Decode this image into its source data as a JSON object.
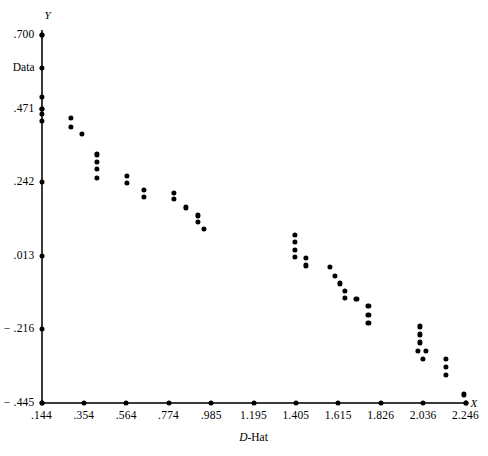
{
  "chart_data": {
    "type": "scatter",
    "title": "",
    "subtitle": "",
    "xlabel": "D-Hat",
    "ylabel": "Data",
    "x_axis_symbol": "X",
    "y_axis_symbol": "Y",
    "xlim": [
      0.144,
      2.246
    ],
    "ylim": [
      -0.445,
      0.7
    ],
    "grid": false,
    "legend": "none",
    "x_ticks": [
      0.144,
      0.354,
      0.564,
      0.774,
      0.985,
      1.195,
      1.405,
      1.615,
      1.826,
      2.036,
      2.246
    ],
    "x_tick_labels": [
      ".144",
      ".354",
      ".564",
      ".774",
      ".985",
      "1.195",
      "1.405",
      "1.615",
      "1.826",
      "2.036",
      "2.246"
    ],
    "y_ticks": [
      0.7,
      0.471,
      0.242,
      0.013,
      -0.216,
      -0.445
    ],
    "y_tick_labels": [
      ".700",
      ".471",
      ".242",
      ".013",
      "− .216",
      "− .445"
    ],
    "series": [
      {
        "name": "Data",
        "marker": "filled-circle",
        "color": "#000000",
        "points": [
          [
            0.144,
            0.7
          ],
          [
            0.144,
            0.597
          ],
          [
            0.144,
            0.508
          ],
          [
            0.144,
            0.471
          ],
          [
            0.144,
            0.455
          ],
          [
            0.144,
            0.432
          ],
          [
            0.29,
            0.441
          ],
          [
            0.29,
            0.414
          ],
          [
            0.345,
            0.393
          ],
          [
            0.42,
            0.328
          ],
          [
            0.42,
            0.305
          ],
          [
            0.42,
            0.283
          ],
          [
            0.42,
            0.256
          ],
          [
            0.566,
            0.262
          ],
          [
            0.566,
            0.238
          ],
          [
            0.65,
            0.218
          ],
          [
            0.65,
            0.196
          ],
          [
            0.8,
            0.207
          ],
          [
            0.8,
            0.19
          ],
          [
            0.86,
            0.163
          ],
          [
            0.92,
            0.138
          ],
          [
            0.92,
            0.117
          ],
          [
            0.95,
            0.096
          ],
          [
            1.4,
            0.078
          ],
          [
            1.4,
            0.055
          ],
          [
            1.4,
            0.03
          ],
          [
            1.4,
            0.008
          ],
          [
            1.455,
            0.006
          ],
          [
            1.455,
            -0.018
          ],
          [
            1.575,
            -0.023
          ],
          [
            1.6,
            -0.05
          ],
          [
            1.625,
            -0.074
          ],
          [
            1.65,
            -0.097
          ],
          [
            1.65,
            -0.12
          ],
          [
            1.705,
            -0.122
          ],
          [
            1.765,
            -0.145
          ],
          [
            1.765,
            -0.172
          ],
          [
            1.765,
            -0.197
          ],
          [
            2.02,
            -0.208
          ],
          [
            2.02,
            -0.233
          ],
          [
            2.02,
            -0.258
          ],
          [
            2.01,
            -0.283
          ],
          [
            2.05,
            -0.283
          ],
          [
            2.035,
            -0.308
          ],
          [
            2.15,
            -0.31
          ],
          [
            2.15,
            -0.335
          ],
          [
            2.15,
            -0.358
          ],
          [
            2.24,
            -0.42
          ],
          [
            2.246,
            -0.445
          ]
        ]
      }
    ]
  }
}
